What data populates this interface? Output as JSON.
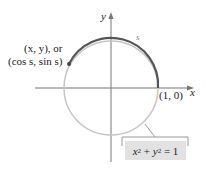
{
  "diagram": {
    "axes": {
      "x_label": "x",
      "y_label": "y"
    },
    "point_label_line1": "(x, y), or",
    "point_label_line2": "(cos s, sin s)",
    "arc_label": "s",
    "intercept_label": "(1, 0)",
    "equation": "x² + y² = 1",
    "colors": {
      "circle": "#c6c6c6",
      "arc": "#555555",
      "axes": "#777777",
      "eq_bg": "#e2e2e2"
    }
  }
}
